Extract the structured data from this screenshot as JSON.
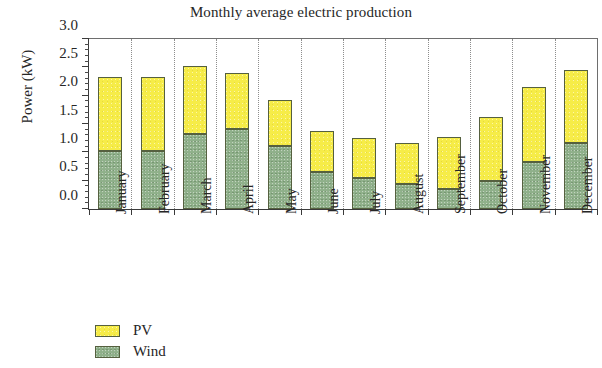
{
  "chart_data": {
    "type": "bar",
    "subtype": "stacked-vertical",
    "title": "Monthly average electric production",
    "xlabel": "",
    "ylabel": "Power (kW)",
    "categories": [
      "January",
      "February",
      "March",
      "April",
      "May",
      "June",
      "July",
      "August",
      "September",
      "October",
      "November",
      "December"
    ],
    "series": [
      {
        "name": "Wind",
        "color": "#8fb08a",
        "values": [
          1.03,
          1.03,
          1.32,
          1.41,
          1.12,
          0.65,
          0.55,
          0.45,
          0.36,
          0.5,
          0.83,
          1.17
        ]
      },
      {
        "name": "PV",
        "color": "#f6ec48",
        "values": [
          1.3,
          1.3,
          1.21,
          0.99,
          0.81,
          0.73,
          0.7,
          0.72,
          0.91,
          1.12,
          1.32,
          1.29
        ]
      }
    ],
    "totals": [
      2.33,
      2.33,
      2.53,
      2.4,
      1.93,
      1.38,
      1.25,
      1.17,
      1.27,
      1.62,
      2.15,
      2.46
    ],
    "stack_order": [
      "Wind",
      "PV"
    ],
    "ylim": [
      0.0,
      3.0
    ],
    "ytick_values": [
      0.0,
      0.5,
      1.0,
      1.5,
      2.0,
      2.5,
      3.0
    ],
    "ytick_labels": [
      "0.0",
      "0.5",
      "1.0",
      "1.5",
      "2.0",
      "2.5",
      "3.0"
    ],
    "y_minor_tick_step": 0.1,
    "grid": {
      "vertical": true,
      "horizontal": false,
      "style": "dotted",
      "color": "#8d8d8d"
    },
    "legend": {
      "position": "bottom-left",
      "entries": [
        {
          "label": "PV",
          "color": "#f6ec48"
        },
        {
          "label": "Wind",
          "color": "#8fb08a"
        }
      ]
    },
    "axis_color": "#3a3a3a",
    "background": "#ffffff"
  }
}
